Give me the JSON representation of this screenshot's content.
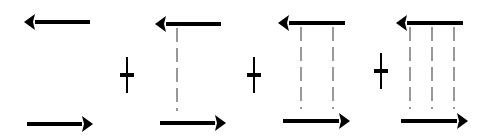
{
  "diagram": {
    "colors": {
      "arrow": "#000000",
      "dash": "#555555",
      "background": "#ffffff"
    },
    "panels": [
      {
        "id": "panel-1",
        "connectors": 0,
        "top_arrow": {
          "x1": 90,
          "x2": 24,
          "y": 22
        },
        "bottom_arrow": {
          "x1": 27,
          "x2": 93,
          "y": 124
        },
        "connector_x": []
      },
      {
        "id": "panel-2",
        "connectors": 1,
        "top_arrow": {
          "x1": 221,
          "x2": 155,
          "y": 24
        },
        "bottom_arrow": {
          "x1": 160,
          "x2": 226,
          "y": 123
        },
        "connector_x": [
          177
        ]
      },
      {
        "id": "panel-3",
        "connectors": 2,
        "top_arrow": {
          "x1": 345,
          "x2": 278,
          "y": 23
        },
        "bottom_arrow": {
          "x1": 283,
          "x2": 350,
          "y": 121
        },
        "connector_x": [
          301,
          333
        ]
      },
      {
        "id": "panel-4",
        "connectors": 3,
        "top_arrow": {
          "x1": 463,
          "x2": 396,
          "y": 23
        },
        "bottom_arrow": {
          "x1": 401,
          "x2": 468,
          "y": 121
        },
        "connector_x": [
          410,
          432,
          454
        ]
      }
    ],
    "operators": [
      {
        "symbol": "+",
        "x": 127,
        "y": 75
      },
      {
        "symbol": "+",
        "x": 254,
        "y": 75
      },
      {
        "symbol": "+",
        "x": 381,
        "y": 71
      }
    ]
  }
}
